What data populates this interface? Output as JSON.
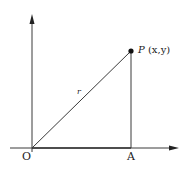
{
  "diagram": {
    "type": "coordinate-geometry",
    "points": {
      "origin": {
        "label": "O",
        "x": 32,
        "y": 148
      },
      "foot": {
        "label": "A",
        "x": 131,
        "y": 148
      },
      "point": {
        "label_main": "P",
        "label_coords": "(x,y)",
        "x": 131,
        "y": 51
      }
    },
    "segments": [
      {
        "name": "hypotenuse",
        "from": "O",
        "to": "P",
        "label": "r"
      },
      {
        "name": "vertical-leg",
        "from": "P",
        "to": "A"
      },
      {
        "name": "horizontal-leg",
        "from": "O",
        "to": "A"
      }
    ],
    "axes": {
      "x_axis": {
        "from_x": 10,
        "to_x": 178,
        "y": 148,
        "arrow": true
      },
      "y_axis": {
        "x": 32,
        "from_y": 152,
        "to_y": 14,
        "arrow": true
      }
    },
    "labels": {
      "origin": "O",
      "foot": "A",
      "radius": "r",
      "point_name": "P",
      "point_coords": "(x,y)"
    },
    "colors": {
      "line": "#3a3a3a",
      "point": "#111111",
      "text": "#222222",
      "background": "#ffffff"
    }
  }
}
